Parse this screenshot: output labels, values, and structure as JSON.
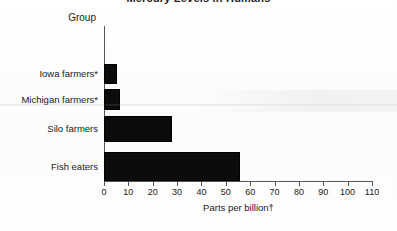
{
  "chart_data": {
    "type": "bar",
    "orientation": "horizontal",
    "title": "Mercury Levels in Humans",
    "categories": [
      "Iowa farmers*",
      "Michigan farmers*",
      "Silo farmers",
      "Fish eaters"
    ],
    "values": [
      5.5,
      6.5,
      28,
      56
    ],
    "xlabel": "Parts per billion†",
    "ylabel": "Group",
    "xlim": [
      0,
      110
    ],
    "xticks": [
      "0",
      "10",
      "20",
      "30",
      "40",
      "50",
      "60",
      "70",
      "80",
      "90",
      "100",
      "110"
    ],
    "xtick_values": [
      0,
      10,
      20,
      30,
      40,
      50,
      60,
      70,
      80,
      90,
      100,
      110
    ],
    "grid": false,
    "legend": false,
    "bar_color": "#0c0c0c",
    "axis_color": "#555555",
    "background_color": "#fdfdfd"
  },
  "axis": {
    "group_header": "Group",
    "xlabel": "Parts per billion†"
  }
}
